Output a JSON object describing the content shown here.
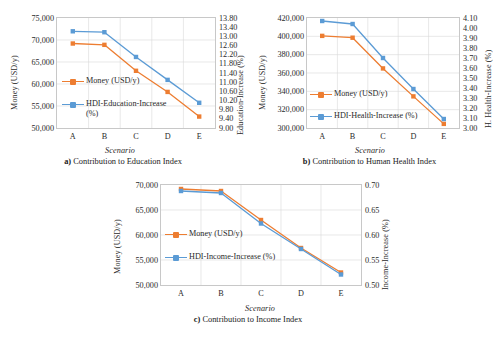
{
  "figure": {
    "x_categories": [
      "A",
      "B",
      "C",
      "D",
      "E"
    ],
    "xlabel": "Scenario",
    "colors": {
      "money": "#ED7D31",
      "hdi": "#5B9BD5",
      "grid": "#D9D9D9",
      "axis": "#C8C8C8"
    }
  },
  "chart_data": [
    {
      "id": "a",
      "type": "line",
      "title": "a)  Contribution to Education Index",
      "caption_prefix": "a)",
      "caption_text": "Contribution to Education Index",
      "xlabel": "Scenario",
      "ylabel": "Money (USD/y)",
      "y2label": "Education-Increase (%)",
      "categories": [
        "A",
        "B",
        "C",
        "D",
        "E"
      ],
      "ylim": [
        50000,
        75000
      ],
      "yticks": [
        "50,000",
        "55,000",
        "60,000",
        "65,000",
        "70,000",
        "75,000"
      ],
      "y2lim": [
        9.0,
        13.8
      ],
      "y2ticks": [
        "9.00",
        "9.40",
        "9.80",
        "10.20",
        "10.60",
        "11.00",
        "11.40",
        "11.80",
        "12.20",
        "12.60",
        "13.00",
        "13.40",
        "13.80"
      ],
      "grid": true,
      "legend_position": "inside-left",
      "series": [
        {
          "name": "Money (USD/y)",
          "axis": "left",
          "color": "#ED7D31",
          "values": [
            69200,
            68900,
            63000,
            58200,
            52600
          ]
        },
        {
          "name": "HDI-Education-Increase (%)",
          "axis": "right",
          "color": "#5B9BD5",
          "values": [
            13.22,
            13.18,
            12.1,
            11.1,
            10.1
          ]
        }
      ]
    },
    {
      "id": "b",
      "type": "line",
      "title": "b)  Contribution to Human Health Index",
      "caption_prefix": "b)",
      "caption_text": "Contribution to Human Health Index",
      "xlabel": "Scenario",
      "ylabel": "Money (USD/y)",
      "y2label": "H. Health-Increase (%)",
      "categories": [
        "A",
        "B",
        "C",
        "D",
        "E"
      ],
      "ylim": [
        300000,
        420000
      ],
      "yticks": [
        "300,000",
        "320,000",
        "340,000",
        "360,000",
        "380,000",
        "400,000",
        "420,000"
      ],
      "y2lim": [
        3.0,
        4.1
      ],
      "y2ticks": [
        "3.00",
        "3.10",
        "3.20",
        "3.30",
        "3.40",
        "3.50",
        "3.60",
        "3.70",
        "3.80",
        "3.90",
        "4.00",
        "4.10"
      ],
      "grid": true,
      "legend_position": "inside-left",
      "series": [
        {
          "name": "Money (USD/y)",
          "axis": "left",
          "color": "#ED7D31",
          "values": [
            400500,
            398500,
            365000,
            334500,
            304500
          ]
        },
        {
          "name": "HDI-Health-Increase (%)",
          "axis": "right",
          "color": "#5B9BD5",
          "values": [
            4.07,
            4.04,
            3.7,
            3.39,
            3.09
          ]
        }
      ]
    },
    {
      "id": "c",
      "type": "line",
      "title": "c)  Contribution to Income Index",
      "caption_prefix": "c)",
      "caption_text": "Contribution to Income Index",
      "xlabel": "Scenario",
      "ylabel": "Money (USD/y)",
      "y2label": "Income-Increase (%)",
      "categories": [
        "A",
        "B",
        "C",
        "D",
        "E"
      ],
      "ylim": [
        50000,
        70000
      ],
      "yticks": [
        "50,000",
        "55,000",
        "60,000",
        "65,000",
        "70,000"
      ],
      "y2lim": [
        0.5,
        0.7
      ],
      "y2ticks": [
        "0.50",
        "0.55",
        "0.60",
        "0.65",
        "0.70"
      ],
      "grid": true,
      "legend_position": "inside-left",
      "series": [
        {
          "name": "Money (USD/y)",
          "axis": "left",
          "color": "#ED7D31",
          "values": [
            69200,
            68800,
            63000,
            57400,
            52500
          ]
        },
        {
          "name": "HDI-Income-Increase (%)",
          "axis": "right",
          "color": "#5B9BD5",
          "values": [
            0.688,
            0.684,
            0.623,
            0.572,
            0.521
          ]
        }
      ]
    }
  ]
}
